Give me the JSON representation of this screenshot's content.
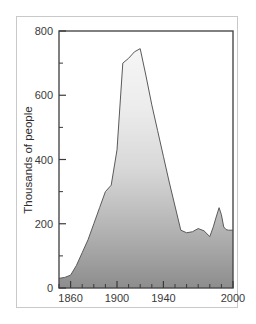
{
  "figure": {
    "background_color": "#ffffff",
    "border_color": "#c9c9c9"
  },
  "chart_data": {
    "type": "area",
    "title": "",
    "subtitle": "",
    "xlabel": "",
    "ylabel": "Thousands of people",
    "xlim": [
      1850,
      2000
    ],
    "ylim": [
      0,
      800
    ],
    "grid": false,
    "legend": null,
    "axis": {
      "x_major_ticks": [
        1860,
        1900,
        1940,
        2000
      ],
      "x_major_tick_labels": [
        "1860",
        "1900",
        "1940",
        "2000"
      ],
      "x_minor_tick_interval": 10,
      "y_major_ticks": [
        0,
        200,
        400,
        600,
        800
      ],
      "y_major_tick_labels": [
        "0",
        "200",
        "400",
        "600",
        "800"
      ],
      "y_minor_tick_interval": 100
    },
    "style": {
      "fill_top_color": "#f4f4f4",
      "fill_bottom_color": "#8d8d8d",
      "line_color": "#5a5a5a",
      "frame_color": "#4a4a4a",
      "tick_label_color": "#3a3a3a"
    },
    "x": [
      1850,
      1855,
      1860,
      1865,
      1870,
      1875,
      1880,
      1885,
      1890,
      1895,
      1900,
      1905,
      1910,
      1915,
      1920,
      1925,
      1930,
      1935,
      1940,
      1945,
      1950,
      1955,
      1960,
      1965,
      1970,
      1975,
      1980,
      1983,
      1985,
      1988,
      1990,
      1992,
      1994,
      1996,
      2000
    ],
    "values": [
      30,
      33,
      40,
      70,
      110,
      150,
      200,
      250,
      300,
      320,
      430,
      700,
      715,
      735,
      745,
      660,
      570,
      490,
      410,
      330,
      255,
      180,
      172,
      175,
      185,
      178,
      160,
      190,
      215,
      250,
      228,
      190,
      182,
      180,
      180
    ],
    "annotations": []
  },
  "y_axis_title": "Thousands of people"
}
